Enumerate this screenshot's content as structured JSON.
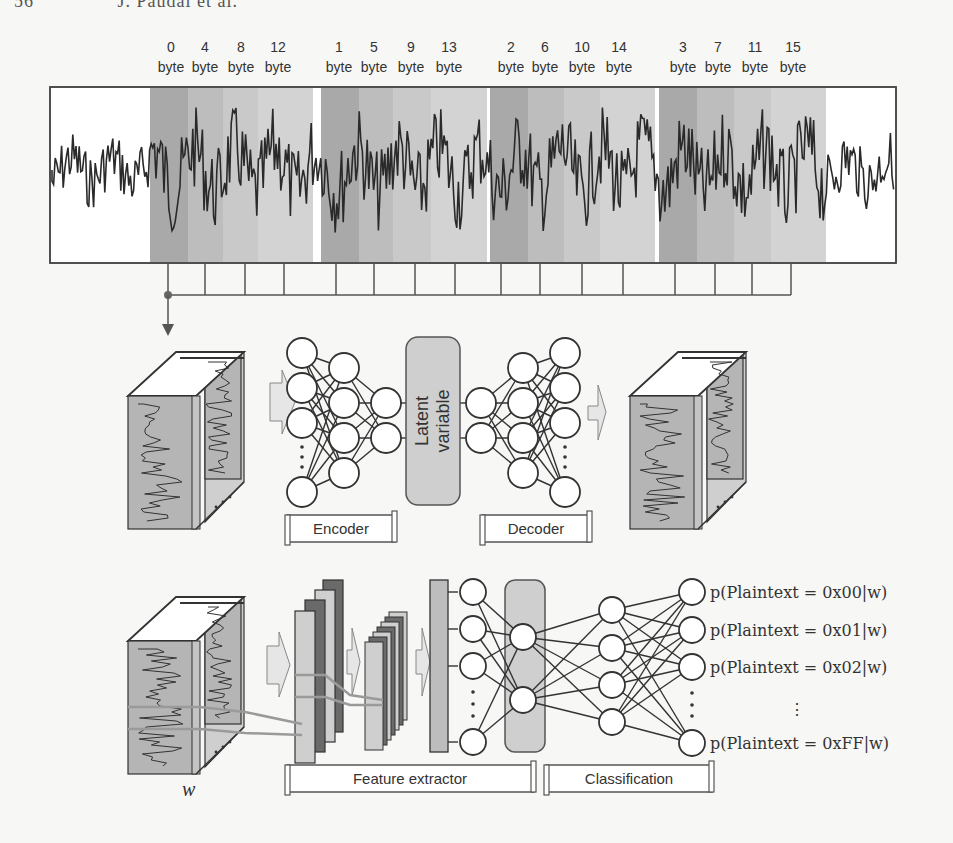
{
  "running_header": {
    "page_number": "56",
    "authors": "J. Paudal et al."
  },
  "trace_panel": {
    "byte_columns": [
      {
        "number": "0",
        "unit": "byte"
      },
      {
        "number": "4",
        "unit": "byte"
      },
      {
        "number": "8",
        "unit": "byte"
      },
      {
        "number": "12",
        "unit": "byte"
      },
      {
        "number": "1",
        "unit": "byte"
      },
      {
        "number": "5",
        "unit": "byte"
      },
      {
        "number": "9",
        "unit": "byte"
      },
      {
        "number": "13",
        "unit": "byte"
      },
      {
        "number": "2",
        "unit": "byte"
      },
      {
        "number": "6",
        "unit": "byte"
      },
      {
        "number": "10",
        "unit": "byte"
      },
      {
        "number": "14",
        "unit": "byte"
      },
      {
        "number": "3",
        "unit": "byte"
      },
      {
        "number": "7",
        "unit": "byte"
      },
      {
        "number": "11",
        "unit": "byte"
      },
      {
        "number": "15",
        "unit": "byte"
      }
    ],
    "band_colors": [
      "#a9a9a9",
      "#bdbdbd",
      "#c9c9c9",
      "#d3d3d3"
    ],
    "trace_color": "#2a2a2a"
  },
  "autoencoder": {
    "latent_label_line1": "Latent",
    "latent_label_line2": "variable",
    "encoder_label": "Encoder",
    "decoder_label": "Decoder"
  },
  "classifier": {
    "feature_extractor_label": "Feature extractor",
    "classification_label": "Classification",
    "input_label": "w",
    "outputs": [
      "p(Plaintext = 0x00|w)",
      "p(Plaintext = 0x01|w)",
      "p(Plaintext = 0x02|w)",
      "p(Plaintext = 0xFF|w)"
    ],
    "ellipsis": "⋮"
  },
  "colors": {
    "line": "#333333",
    "panel_gray": "#b5b5b5",
    "latent_fill": "#cfcfcf",
    "conv_dark": "#6a6a6a",
    "conv_light": "#cfcfcf",
    "arrow_fill": "#e6e6e6",
    "highlight_line": "#9a9a9a"
  }
}
